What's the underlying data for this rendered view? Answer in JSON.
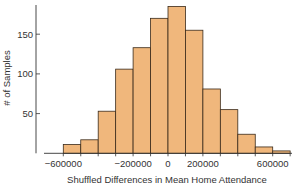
{
  "chart_data": {
    "type": "bar",
    "title": "",
    "xlabel": "Shuffled Differences in Mean Home Attendance",
    "ylabel": "# of Samples",
    "bin_edges": [
      -600000,
      -500000,
      -400000,
      -300000,
      -200000,
      -100000,
      0,
      100000,
      200000,
      300000,
      400000,
      500000,
      600000,
      700000
    ],
    "categories": [
      "-600000 to -500000",
      "-500000 to -400000",
      "-400000 to -300000",
      "-300000 to -200000",
      "-200000 to -100000",
      "-100000 to 0",
      "0 to 100000",
      "100000 to 200000",
      "200000 to 300000",
      "300000 to 400000",
      "400000 to 500000",
      "500000 to 600000",
      "600000 to 700000"
    ],
    "values": [
      11,
      17,
      53,
      106,
      133,
      170,
      185,
      155,
      81,
      55,
      24,
      8,
      3
    ],
    "xticks": [
      -600000,
      -200000,
      0,
      200000,
      600000
    ],
    "xtick_labels": [
      "−600000",
      "−200000",
      "0",
      "200000",
      "600000"
    ],
    "yticks": [
      50,
      100,
      150
    ],
    "ytick_labels": [
      "50",
      "100",
      "150"
    ],
    "ylim": [
      0,
      187
    ],
    "xlim": [
      -700000,
      750000
    ],
    "grid": false,
    "legend": null,
    "bar_color": "#F0B77C",
    "edge_color": "#3a2a1a"
  }
}
